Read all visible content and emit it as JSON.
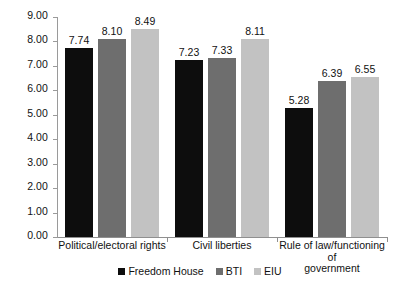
{
  "chart_data": {
    "type": "bar",
    "title": "",
    "subtitle": "",
    "xlabel": "",
    "ylabel": "",
    "ylim": [
      0,
      9
    ],
    "grid": false,
    "legend_position": "bottom",
    "categories": [
      "Political/electoral rights",
      "Civil liberties",
      "Rule of law/functioning of\ngovernment"
    ],
    "y_ticks": [
      "0.00",
      "1.00",
      "2.00",
      "3.00",
      "4.00",
      "5.00",
      "6.00",
      "7.00",
      "8.00",
      "9.00"
    ],
    "series": [
      {
        "name": "Freedom House",
        "color": "#0d0d0d",
        "values": [
          7.74,
          7.23,
          5.28
        ],
        "labels": [
          "7.74",
          "7.23",
          "5.28"
        ]
      },
      {
        "name": "BTI",
        "color": "#6e6e6e",
        "values": [
          8.1,
          7.33,
          6.39
        ],
        "labels": [
          "8.10",
          "7.33",
          "6.39"
        ]
      },
      {
        "name": "EIU",
        "color": "#c2c2c2",
        "values": [
          8.49,
          8.11,
          6.55
        ],
        "labels": [
          "8.49",
          "8.11",
          "6.55"
        ]
      }
    ]
  },
  "legend": {
    "items": [
      {
        "label": "Freedom House",
        "color": "#0d0d0d"
      },
      {
        "label": "BTI",
        "color": "#6e6e6e"
      },
      {
        "label": "EIU",
        "color": "#c2c2c2"
      }
    ]
  }
}
